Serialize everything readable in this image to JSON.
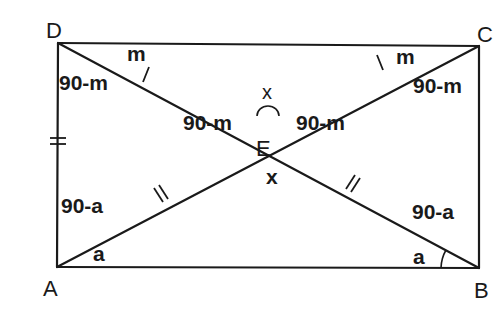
{
  "diagram": {
    "vertices": {
      "A": {
        "label": "A",
        "x": 57,
        "y": 267
      },
      "B": {
        "label": "B",
        "x": 479,
        "y": 268
      },
      "C": {
        "label": "C",
        "x": 479,
        "y": 46
      },
      "D": {
        "label": "D",
        "x": 58,
        "y": 43
      },
      "E": {
        "label": "E",
        "x": 268,
        "y": 120
      }
    },
    "angle_labels": {
      "D_top": "m",
      "D_side": "90-m",
      "C_top": "m",
      "C_side": "90-m",
      "E_left": "90-m",
      "E_right": "90-m",
      "E_top": "x",
      "E_bottom": "x",
      "A_side": "90-a",
      "A_bottom": "a",
      "B_side": "90-a",
      "B_bottom": "a"
    },
    "tick_marks": {
      "DE": "single",
      "EC": "single",
      "AE": "double",
      "EB": "double",
      "DA": "double"
    },
    "colors": {
      "stroke": "#1a1a1a",
      "background": "#ffffff"
    }
  }
}
